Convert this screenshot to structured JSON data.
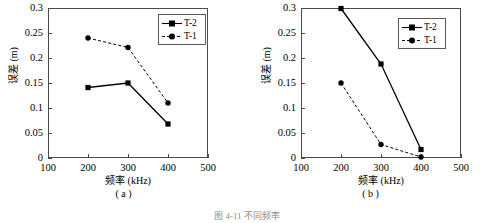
{
  "figure": {
    "caption": "图 4-11  不同频率",
    "panels": [
      {
        "id": "a",
        "sublabel": "( a )",
        "xlabel": "频率 (kHz)",
        "ylabel": "误差 (m)",
        "legend": [
          {
            "label": "T-2",
            "style": "solid",
            "marker": "square"
          },
          {
            "label": "T-1",
            "style": "dashed",
            "marker": "circle"
          }
        ]
      },
      {
        "id": "b",
        "sublabel": "( b )",
        "xlabel": "频率 (kHz)",
        "ylabel": "误差 (m)",
        "legend": [
          {
            "label": "T-2",
            "style": "solid",
            "marker": "square"
          },
          {
            "label": "T-1",
            "style": "dashed",
            "marker": "circle"
          }
        ]
      }
    ]
  },
  "chart_data": [
    {
      "type": "line",
      "panel": "a",
      "title": "( a )",
      "xlabel": "频率 (kHz)",
      "ylabel": "误差 (m)",
      "x": [
        200,
        300,
        400
      ],
      "xlim": [
        100,
        500
      ],
      "ylim": [
        0,
        0.3
      ],
      "xticks": [
        100,
        200,
        300,
        400,
        500
      ],
      "yticks": [
        0,
        0.05,
        0.1,
        0.15,
        0.2,
        0.25,
        0.3
      ],
      "xticklabels": [
        "100",
        "200",
        "300",
        "400",
        "500"
      ],
      "yticklabels": [
        "0",
        "0.05",
        "0.1",
        "0.15",
        "0.2",
        "0.25",
        "0.3"
      ],
      "grid": false,
      "legend_position": "upper right",
      "series": [
        {
          "name": "T-2",
          "values": [
            0.141,
            0.15,
            0.068
          ],
          "style": "solid",
          "marker": "square",
          "color": "#000000"
        },
        {
          "name": "T-1",
          "values": [
            0.24,
            0.221,
            0.11
          ],
          "style": "dashed",
          "marker": "circle",
          "color": "#000000"
        }
      ]
    },
    {
      "type": "line",
      "panel": "b",
      "title": "( b )",
      "xlabel": "频率 (kHz)",
      "ylabel": "误差 (m)",
      "x": [
        200,
        300,
        400
      ],
      "xlim": [
        100,
        500
      ],
      "ylim": [
        0,
        0.3
      ],
      "xticks": [
        100,
        200,
        300,
        400,
        500
      ],
      "yticks": [
        0,
        0.05,
        0.1,
        0.15,
        0.2,
        0.25,
        0.3
      ],
      "xticklabels": [
        "100",
        "200",
        "300",
        "400",
        "500"
      ],
      "yticklabels": [
        "0",
        "0.05",
        "0.1",
        "0.15",
        "0.2",
        "0.25",
        "0.3"
      ],
      "grid": false,
      "legend_position": "upper right",
      "series": [
        {
          "name": "T-2",
          "values": [
            0.299,
            0.188,
            0.017
          ],
          "style": "solid",
          "marker": "square",
          "color": "#000000"
        },
        {
          "name": "T-1",
          "values": [
            0.15,
            0.027,
            0.002
          ],
          "style": "dashed",
          "marker": "circle",
          "color": "#000000"
        }
      ]
    }
  ]
}
